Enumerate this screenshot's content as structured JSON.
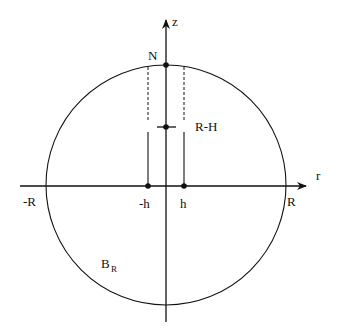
{
  "diagram": {
    "labels": {
      "z_axis": "z",
      "r_axis": "r",
      "north": "N",
      "r_minus_h": "R-H",
      "neg_R": "-R",
      "pos_R": "R",
      "neg_h": "-h",
      "pos_h": "h",
      "ball": "B",
      "ball_sub": "R"
    },
    "colors": {
      "stroke": "#111111",
      "background": "#ffffff"
    }
  }
}
